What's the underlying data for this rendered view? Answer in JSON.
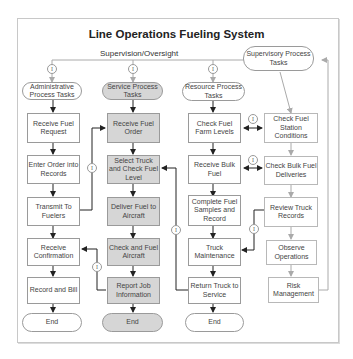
{
  "title": "Line Operations Fueling System",
  "supervision_label": "Supervision/Oversight",
  "info_glyph": "I",
  "columns": {
    "admin": {
      "header": "Administrative Process Tasks",
      "steps": [
        "Receive Fuel Request",
        "Enter Order into Records",
        "Transmit To Fuelers",
        "Receive Confirmation",
        "Record and Bill"
      ],
      "end": "End"
    },
    "service": {
      "header": "Service Process Tasks",
      "steps": [
        "Receive Fuel Order",
        "Select Truck and Check Fuel Level",
        "Deliver Fuel to Aircraft",
        "Check and Fuel Aircraft",
        "Report Job Information"
      ],
      "end": "End"
    },
    "resource": {
      "header": "Resource Process Tasks",
      "steps": [
        "Check Fuel Farm Levels",
        "Receive Bulk Fuel",
        "Complete Fuel Samples and Record",
        "Truck Maintenance",
        "Return Truck to Service"
      ],
      "end": "End"
    },
    "supervisory": {
      "header": "Supervisory Process Tasks",
      "steps": [
        "Check Fuel Station Conditions",
        "Check Bulk Fuel Deliveries",
        "Review Truck Records",
        "Observe Operations",
        "Risk Management"
      ]
    }
  },
  "colors": {
    "service_fill": "#d6d6d6",
    "border": "#9a9a9a",
    "arrow_dark": "#222222",
    "arrow_light": "#aaaaaa",
    "frame": "#c8c8c8"
  }
}
